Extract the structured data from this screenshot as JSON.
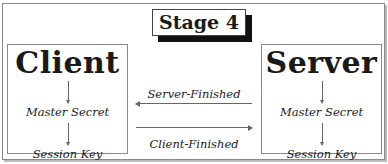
{
  "diagram": {
    "stage_label": "Stage 4",
    "client": {
      "title": "Client",
      "steps": [
        "Master Secret",
        "Session Key"
      ]
    },
    "server": {
      "title": "Server",
      "steps": [
        "Master Secret",
        "Session Key"
      ]
    },
    "messages": [
      {
        "label": "Server-Finished",
        "direction": "server-to-client"
      },
      {
        "label": "Client-Finished",
        "direction": "client-to-server"
      }
    ],
    "colors": {
      "border": "#8a8a8a",
      "text": "#1a1a1a",
      "stage_shadow": "#111111"
    }
  }
}
